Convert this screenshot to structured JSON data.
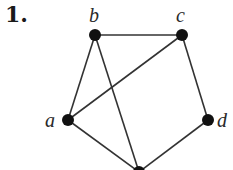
{
  "problem": {
    "number_label": "1."
  },
  "graph": {
    "nodes": [
      {
        "id": "a",
        "label": "a",
        "x": 68,
        "y": 120
      },
      {
        "id": "b",
        "label": "b",
        "x": 95,
        "y": 35
      },
      {
        "id": "c",
        "label": "c",
        "x": 182,
        "y": 35
      },
      {
        "id": "d",
        "label": "d",
        "x": 208,
        "y": 120
      },
      {
        "id": "e",
        "label": "",
        "x": 139,
        "y": 172
      }
    ],
    "edges": [
      [
        "b",
        "c"
      ],
      [
        "b",
        "a"
      ],
      [
        "b",
        "e"
      ],
      [
        "c",
        "a"
      ],
      [
        "c",
        "d"
      ],
      [
        "a",
        "e"
      ],
      [
        "d",
        "e"
      ]
    ],
    "colors": {
      "node": "#111111",
      "edge": "#333333",
      "label": "#2a2a2a"
    }
  }
}
